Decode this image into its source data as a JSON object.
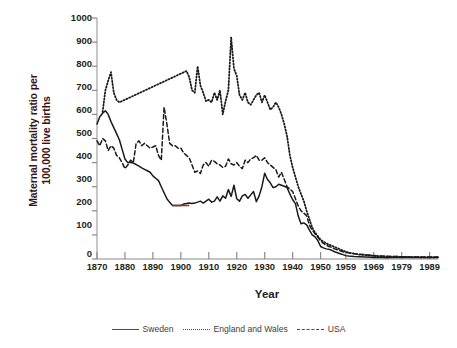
{
  "chart_data": {
    "type": "line",
    "title": "",
    "xlabel": "Year",
    "ylabel_line1": "Maternal mortality ratio per",
    "ylabel_line2": "100,000 live births",
    "xlim": [
      1870,
      1992
    ],
    "ylim": [
      0,
      1000
    ],
    "xticks": [
      1870,
      1880,
      1890,
      1900,
      1910,
      1920,
      1930,
      1940,
      1950,
      1959,
      1969,
      1979,
      1989
    ],
    "xtick_labels": [
      "1870",
      "1880",
      "1890",
      "1900",
      "1910",
      "1920",
      "1930",
      "1940",
      "1950",
      "1959",
      "1969",
      "1979",
      "1989"
    ],
    "yticks": [
      0,
      100,
      200,
      300,
      400,
      500,
      600,
      700,
      800,
      900,
      1000
    ],
    "ytick_labels": [
      "0",
      "100",
      "200",
      "300",
      "400",
      "500",
      "600",
      "700",
      "800",
      "900",
      "1000"
    ],
    "grid": false,
    "legend_position": "bottom-outside",
    "series": [
      {
        "name": "Sweden",
        "style": "solid",
        "color": "#1a1a1a",
        "x": [
          1870,
          1871,
          1872,
          1873,
          1874,
          1875,
          1876,
          1877,
          1878,
          1879,
          1880,
          1881,
          1882,
          1883,
          1884,
          1885,
          1886,
          1887,
          1888,
          1889,
          1890,
          1891,
          1892,
          1893,
          1894,
          1895,
          1896,
          1897,
          1898,
          1899,
          1900,
          1901,
          1902,
          1903,
          1904,
          1905,
          1906,
          1907,
          1908,
          1909,
          1910,
          1911,
          1912,
          1913,
          1914,
          1915,
          1916,
          1917,
          1918,
          1919,
          1920,
          1921,
          1922,
          1923,
          1924,
          1925,
          1926,
          1927,
          1928,
          1929,
          1930,
          1931,
          1932,
          1933,
          1934,
          1935,
          1936,
          1937,
          1938,
          1939,
          1940,
          1941,
          1942,
          1943,
          1944,
          1945,
          1946,
          1947,
          1948,
          1949,
          1950,
          1951,
          1952,
          1953,
          1954,
          1955,
          1956,
          1957,
          1958,
          1959,
          1960,
          1962,
          1964,
          1966,
          1968,
          1970,
          1972,
          1974,
          1976,
          1978,
          1980,
          1982,
          1984,
          1986,
          1988,
          1990,
          1992
        ],
        "y": [
          560,
          590,
          605,
          615,
          600,
          570,
          545,
          520,
          495,
          455,
          415,
          400,
          400,
          398,
          392,
          385,
          378,
          372,
          366,
          360,
          345,
          335,
          325,
          300,
          275,
          250,
          235,
          222,
          222,
          222,
          222,
          228,
          230,
          232,
          230,
          232,
          236,
          240,
          232,
          240,
          248,
          236,
          240,
          258,
          240,
          262,
          252,
          288,
          260,
          306,
          250,
          240,
          262,
          268,
          252,
          266,
          280,
          238,
          262,
          300,
          356,
          330,
          316,
          296,
          300,
          310,
          306,
          302,
          296,
          270,
          246,
          230,
          178,
          146,
          150,
          142,
          120,
          100,
          92,
          76,
          52,
          46,
          42,
          40,
          36,
          30,
          26,
          22,
          18,
          14,
          12,
          10,
          9,
          8,
          7,
          6,
          6,
          5,
          7,
          6,
          6,
          6,
          6,
          6,
          6,
          6,
          6
        ]
      },
      {
        "name": "England and Wales",
        "style": "dotted",
        "color": "#1a1a1a",
        "x": [
          1872,
          1873,
          1874,
          1875,
          1876,
          1877,
          1878,
          1902,
          1903,
          1904,
          1905,
          1906,
          1907,
          1908,
          1909,
          1910,
          1911,
          1912,
          1913,
          1914,
          1915,
          1916,
          1917,
          1918,
          1919,
          1920,
          1921,
          1922,
          1923,
          1924,
          1925,
          1926,
          1927,
          1928,
          1929,
          1930,
          1931,
          1932,
          1933,
          1934,
          1935,
          1936,
          1937,
          1938,
          1939,
          1940,
          1941,
          1942,
          1943,
          1944,
          1945,
          1946,
          1947,
          1948,
          1949,
          1950,
          1951,
          1952,
          1953,
          1954,
          1955,
          1956,
          1957,
          1958,
          1959,
          1960,
          1962,
          1964,
          1966,
          1968,
          1970,
          1972,
          1974,
          1976,
          1978,
          1980,
          1982,
          1984,
          1986,
          1988,
          1990,
          1992
        ],
        "y": [
          610,
          700,
          740,
          775,
          690,
          660,
          650,
          780,
          755,
          700,
          690,
          800,
          720,
          690,
          655,
          660,
          650,
          690,
          660,
          700,
          600,
          655,
          700,
          920,
          790,
          760,
          680,
          660,
          690,
          650,
          640,
          660,
          680,
          690,
          650,
          680,
          650,
          620,
          630,
          650,
          630,
          600,
          560,
          510,
          430,
          380,
          340,
          300,
          270,
          240,
          200,
          165,
          130,
          110,
          95,
          80,
          72,
          65,
          60,
          55,
          50,
          45,
          40,
          35,
          30,
          26,
          22,
          18,
          16,
          14,
          12,
          11,
          10,
          10,
          9,
          9,
          8,
          8,
          7,
          7,
          7,
          7
        ]
      },
      {
        "name": "USA",
        "style": "dashed",
        "color": "#1a1a1a",
        "x": [
          1870,
          1871,
          1872,
          1873,
          1874,
          1875,
          1876,
          1877,
          1878,
          1879,
          1880,
          1881,
          1882,
          1883,
          1884,
          1885,
          1886,
          1887,
          1888,
          1889,
          1890,
          1891,
          1892,
          1893,
          1894,
          1895,
          1896,
          1897,
          1898,
          1899,
          1900,
          1901,
          1902,
          1903,
          1904,
          1905,
          1906,
          1907,
          1908,
          1909,
          1910,
          1911,
          1912,
          1913,
          1914,
          1915,
          1916,
          1917,
          1918,
          1919,
          1920,
          1921,
          1922,
          1923,
          1924,
          1925,
          1926,
          1927,
          1928,
          1929,
          1930,
          1931,
          1932,
          1933,
          1934,
          1935,
          1936,
          1937,
          1938,
          1939,
          1940,
          1941,
          1942,
          1943,
          1944,
          1945,
          1946,
          1947,
          1948,
          1949,
          1950,
          1951,
          1952,
          1953,
          1954,
          1955,
          1956,
          1957,
          1958,
          1959,
          1960,
          1962,
          1964,
          1966,
          1968,
          1970,
          1972,
          1974,
          1976,
          1978,
          1980,
          1982,
          1984,
          1986,
          1988,
          1990,
          1992
        ],
        "y": [
          490,
          470,
          500,
          490,
          450,
          470,
          460,
          430,
          420,
          400,
          375,
          390,
          410,
          400,
          480,
          490,
          470,
          480,
          470,
          460,
          465,
          470,
          430,
          410,
          630,
          560,
          480,
          470,
          470,
          460,
          460,
          440,
          430,
          420,
          390,
          360,
          365,
          355,
          390,
          400,
          385,
          410,
          405,
          395,
          390,
          380,
          385,
          415,
          395,
          390,
          400,
          385,
          375,
          410,
          400,
          415,
          420,
          430,
          410,
          410,
          420,
          400,
          390,
          380,
          370,
          340,
          360,
          330,
          300,
          290,
          280,
          250,
          220,
          200,
          190,
          180,
          140,
          120,
          105,
          90,
          75,
          65,
          58,
          52,
          48,
          42,
          38,
          34,
          30,
          28,
          26,
          22,
          20,
          18,
          15,
          13,
          12,
          11,
          10,
          10,
          9,
          8,
          8,
          8,
          8,
          8,
          8
        ]
      }
    ],
    "annotations": {
      "sweden_highlight_segment": {
        "x_range": [
          1897,
          1903
        ],
        "color": "#8c3a22",
        "note": "short reddish segment on flat Sweden plateau near 220"
      }
    },
    "axis_color": "#a8a8a8",
    "tick_color": "#6e6e6e",
    "line_color": "#1a1a1a"
  },
  "legend": {
    "items": [
      {
        "label": "Sweden",
        "style": "solid"
      },
      {
        "label": "England and Wales",
        "style": "dotted"
      },
      {
        "label": "USA",
        "style": "dashed"
      }
    ]
  }
}
